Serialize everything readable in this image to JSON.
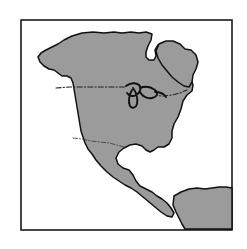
{
  "figure": {
    "title": "North America",
    "alt_text": "Outline map of North America and Central America with national borders",
    "width_px": 247,
    "height_px": 249
  },
  "frame": {
    "name": "map-border-frame",
    "x": 21,
    "y": 20,
    "width": 211,
    "height": 210,
    "stroke_color": "#1a1a1a",
    "fill_color": "#ffffff"
  },
  "style": {
    "land_fill": "#9b9b9b",
    "land_stroke": "#111111",
    "ocean_fill": "#ffffff",
    "page_background": "#ffffff",
    "border_dash_color": "#222222"
  },
  "regions": [
    {
      "name": "north-america-mainland",
      "label": "North America mainland",
      "fill": "#9b9b9b",
      "path": "M 64 40 L 72 36 L 82 33 L 93 32 L 104 33 L 114 32 L 122 33 L 131 32 L 139 33 L 146 32 L 152 34 L 151 40 L 148 46 L 146 52 L 146 57 L 149 60 L 154 60 L 156 56 L 155 50 L 158 45 L 164 42 L 171 42 L 178 45 L 183 50 L 188 50 L 193 53 L 196 59 L 195 66 L 192 72 L 191 79 L 193 85 L 192 91 L 187 95 L 183 101 L 181 109 L 178 117 L 174 124 L 172 131 L 172 138 L 169 144 L 164 147 L 158 147 L 154 150 L 150 152 L 146 150 L 142 146 L 136 144 L 130 145 L 124 148 L 119 152 L 116 158 L 118 164 L 123 168 L 129 170 L 133 175 L 136 181 L 140 186 L 146 189 L 152 192 L 157 196 L 162 199 L 167 203 L 171 208 L 174 213 L 172 217 L 167 216 L 161 212 L 155 207 L 149 202 L 143 197 L 137 192 L 131 188 L 125 185 L 119 181 L 113 177 L 107 172 L 101 166 L 96 160 L 92 154 L 88 149 L 85 143 L 83 137 L 81 131 L 80 125 L 79 119 L 78 113 L 77 107 L 76 101 L 75 95 L 74 89 L 73 83 L 71 78 L 67 76 L 62 76 L 58 73 L 54 70 L 49 69 L 44 66 L 40 62 L 38 57 L 41 53 L 46 50 L 52 47 L 58 44 Z"
    },
    {
      "name": "greenland-labrador-lobe",
      "label": "Greenland and Labrador lobe",
      "fill": "#9b9b9b",
      "path": "M 159 44 L 166 41 L 173 41 L 180 44 L 185 49 L 191 50 L 196 55 L 198 62 L 196 69 L 193 75 L 192 82 L 189 87 L 184 86 L 178 82 L 172 77 L 167 71 L 162 65 L 158 58 L 156 51 Z"
    },
    {
      "name": "south-america-corner",
      "label": "South America (northwest corner)",
      "fill": "#9b9b9b",
      "path": "M 174 196 L 181 192 L 189 189 L 197 188 L 205 189 L 212 188 L 219 187 L 226 187 L 232 188 L 232 229 L 185 229 L 182 224 L 179 218 L 176 212 L 173 205 Z"
    }
  ],
  "lakes": {
    "name": "great-lakes",
    "label": "Great Lakes",
    "path": "M 126 86 C 130 83 136 82 139 85 C 142 88 140 93 136 95 C 133 97 129 96 127 93 M 133 88 C 136 92 138 98 137 104 C 136 108 132 109 130 106 C 128 102 129 95 132 90 M 140 88 C 145 86 151 87 155 90 C 159 93 157 97 152 98 C 147 99 142 96 140 92 M 155 92 C 160 92 164 94 166 97"
  },
  "borders": [
    {
      "name": "us-canada-border",
      "label": "United States – Canada border",
      "style": "dash-dot",
      "emphasis": "strong",
      "path": "M 56 88 L 70 87 L 86 87 L 102 87 L 118 87 L 126 87 M 142 92 L 152 95 L 162 96 L 172 95 L 180 93 L 187 90"
    },
    {
      "name": "us-mexico-border",
      "label": "United States – Mexico border",
      "style": "dash-dot",
      "emphasis": "faint",
      "path": "M 73 138 L 82 139 L 91 141 L 100 142 L 109 143 L 117 145 L 124 147"
    }
  ],
  "legend": {
    "visible": false,
    "entries": []
  },
  "labels": {
    "visible": false,
    "items": []
  }
}
